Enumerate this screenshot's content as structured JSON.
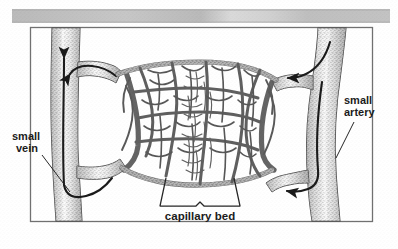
{
  "document": {
    "type": "scanned-textbook-illustration",
    "subject": "capillary bed connecting a small vein and a small artery",
    "background_color": "#ffffff",
    "frame_border_color": "#5a5a5a",
    "ink_color": "#1a1a1a"
  },
  "scan_band": {
    "present": true,
    "label": "",
    "color_left": "#b9b9b9",
    "color_mid": "#d2d2d2",
    "color_right": "#bdbdbd"
  },
  "labels": {
    "vein": {
      "line1": "small",
      "line2": "vein"
    },
    "artery": {
      "line1": "small",
      "line2": "artery"
    },
    "capillary_bed": "capillary bed"
  },
  "vessels": {
    "vein": {
      "name": "small vein",
      "side": "left",
      "flow_direction": "upward",
      "arrow_count": 2,
      "shading": "stippled-gray"
    },
    "artery": {
      "name": "small artery",
      "side": "right",
      "flow_direction": "downward",
      "arrow_count": 2,
      "shading": "stippled-gray"
    },
    "capillary_bed": {
      "name": "capillary bed",
      "position": "center",
      "description": "dense anastomosing network of fine vessels"
    }
  }
}
